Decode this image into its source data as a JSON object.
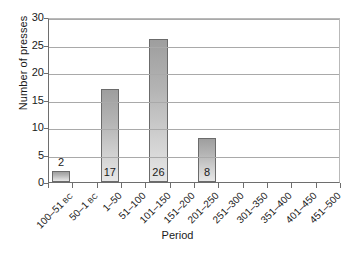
{
  "chart_data": {
    "type": "bar",
    "title": "",
    "xlabel": "Period",
    "ylabel": "Number of presses",
    "categories": [
      "100–51 BC",
      "50–1 BC",
      "1–50",
      "51–100",
      "101–150",
      "151–200",
      "201–250",
      "251–300",
      "301–350",
      "351–400",
      "401–450",
      "451–500"
    ],
    "category_parts": [
      {
        "main": "100–51",
        "era": "BC"
      },
      {
        "main": "50–1",
        "era": "BC"
      },
      {
        "main": "1–50",
        "era": ""
      },
      {
        "main": "51–100",
        "era": ""
      },
      {
        "main": "101–150",
        "era": ""
      },
      {
        "main": "151–200",
        "era": ""
      },
      {
        "main": "201–250",
        "era": ""
      },
      {
        "main": "251–300",
        "era": ""
      },
      {
        "main": "301–350",
        "era": ""
      },
      {
        "main": "351–400",
        "era": ""
      },
      {
        "main": "401–450",
        "era": ""
      },
      {
        "main": "451–500",
        "era": ""
      }
    ],
    "values": [
      2,
      0,
      17,
      0,
      26,
      0,
      8,
      0,
      0,
      0,
      0,
      0
    ],
    "data_labels": [
      "2",
      "",
      "17",
      "",
      "26",
      "",
      "8",
      "",
      "",
      "",
      "",
      ""
    ],
    "ylim": [
      0,
      30
    ],
    "ytick_values": [
      0,
      5,
      10,
      15,
      20,
      25,
      30
    ],
    "ytick_labels": [
      "0",
      "5",
      "10",
      "15",
      "20",
      "25",
      "30"
    ],
    "grid": true,
    "legend": "none",
    "bar_color_top": "#9e9e9e",
    "bar_color_bottom": "#e7e7e7",
    "bar_border_color": "#6b6b6b",
    "gridline_color": "#a9a9a9",
    "axis_color": "#6e6e6e"
  }
}
